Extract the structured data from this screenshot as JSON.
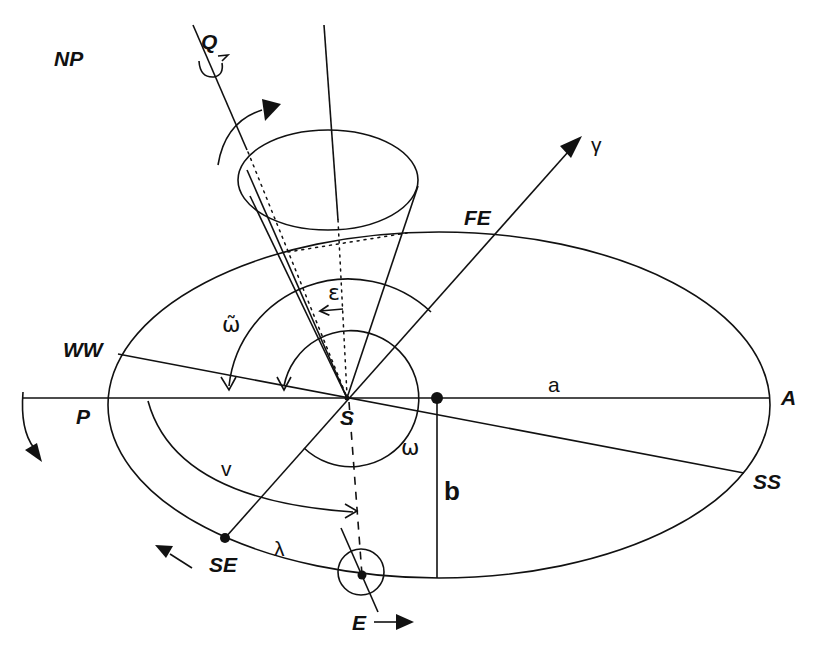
{
  "diagram": {
    "labels": {
      "north_pole": "NP",
      "ecliptic_pole": "Q",
      "vernal_point": "γ",
      "fall_equinox": "FE",
      "winter_solstice": "WW",
      "perihelion": "P",
      "aphelion": "A",
      "sun": "S",
      "summer_solstice": "SS",
      "spring_equinox": "SE",
      "earth": "E",
      "semi_major_axis": "a",
      "semi_minor_axis": "b",
      "obliquity": "ε",
      "longitude_of_perihelion": "ω̃",
      "argument_of_perihelion": "ω",
      "true_anomaly": "v",
      "true_longitude": "λ"
    },
    "colors": {
      "stroke": "#111111",
      "background": "#ffffff"
    }
  }
}
